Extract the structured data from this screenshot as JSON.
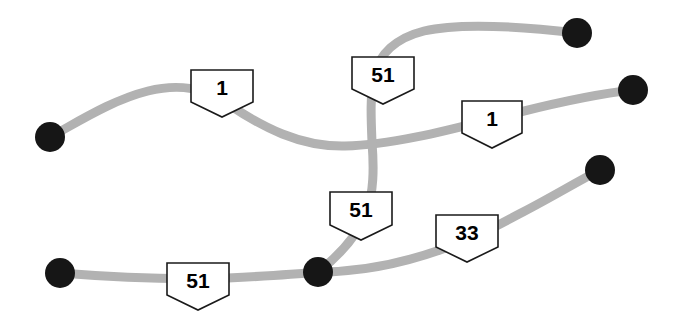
{
  "diagram": {
    "width": 684,
    "height": 315,
    "background_color": "#ffffff",
    "road_color": "#b2b2b2",
    "road_width": 9,
    "node_color": "#161616",
    "node_radius": 15,
    "shield_fill": "#ffffff",
    "shield_stroke": "#1a1a1a"
  },
  "chart_data": {
    "type": "diagram",
    "nodes": [
      {
        "id": "n1",
        "label": "node-west",
        "x": 50,
        "y": 137
      },
      {
        "id": "n2",
        "label": "node-northeast",
        "x": 577,
        "y": 33
      },
      {
        "id": "n3",
        "label": "node-east",
        "x": 633,
        "y": 90
      },
      {
        "id": "n4",
        "label": "node-southeast",
        "x": 600,
        "y": 170
      },
      {
        "id": "n5",
        "label": "node-southwest",
        "x": 60,
        "y": 273
      },
      {
        "id": "n6",
        "label": "node-junction",
        "x": 318,
        "y": 272
      }
    ],
    "edges": [
      {
        "id": "e1",
        "label": "west-to-east-corridor",
        "from": "n1",
        "to": "n3",
        "shields": [
          "s1",
          "s3"
        ]
      },
      {
        "id": "e2",
        "label": "route-51-north-spur",
        "from": "n6",
        "to": "n2",
        "shields": [
          "s2",
          "s4"
        ]
      },
      {
        "id": "e3",
        "label": "southwest-to-junction",
        "from": "n5",
        "to": "n6",
        "shields": [
          "s5"
        ]
      },
      {
        "id": "e4",
        "label": "junction-to-southeast",
        "from": "n6",
        "to": "n4",
        "shields": [
          "s6"
        ]
      }
    ],
    "crossings": [
      {
        "label": "grade-separated-crossing",
        "x": 371,
        "y": 142
      }
    ],
    "shields": [
      {
        "id": "s1",
        "number": "1",
        "x": 222,
        "y": 93
      },
      {
        "id": "s2",
        "number": "51",
        "x": 383,
        "y": 80
      },
      {
        "id": "s3",
        "number": "1",
        "x": 492,
        "y": 124
      },
      {
        "id": "s4",
        "number": "51",
        "x": 361,
        "y": 216
      },
      {
        "id": "s5",
        "number": "51",
        "x": 198,
        "y": 286
      },
      {
        "id": "s6",
        "number": "33",
        "x": 467,
        "y": 238
      }
    ]
  }
}
